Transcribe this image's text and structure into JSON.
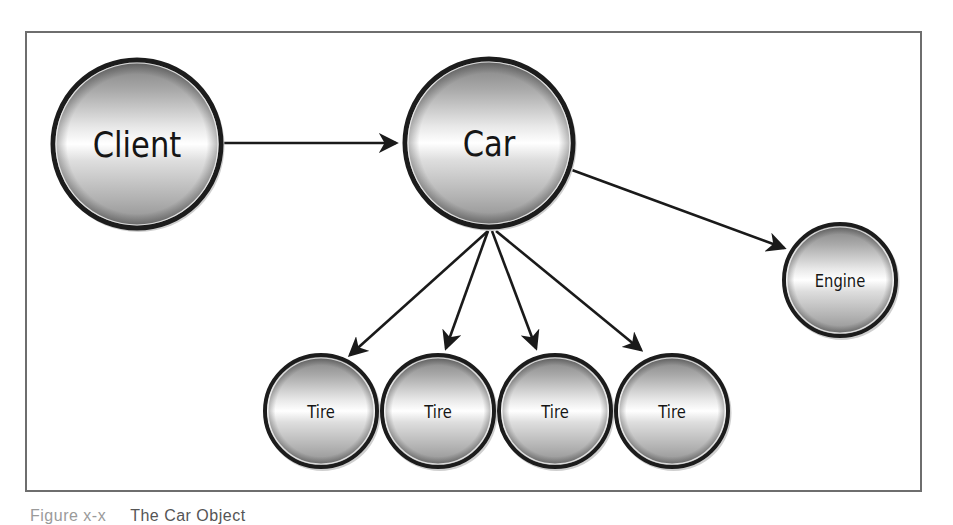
{
  "figure": {
    "caption_number": "Figure x-x",
    "caption_title": "The Car Object"
  },
  "colors": {
    "frame_border": "#6e6e6e",
    "node_outline": "#1c1c1c",
    "node_gradient_top": "#8a8a8a",
    "node_gradient_mid": "#f6f6f6",
    "node_gradient_bottom": "#9c9c9c",
    "edge": "#1a1a1a",
    "label": "#151515"
  },
  "nodes": [
    {
      "id": "client",
      "label": "Client",
      "cx": 137,
      "cy": 144,
      "r": 86,
      "font_size": 36
    },
    {
      "id": "car",
      "label": "Car",
      "cx": 489,
      "cy": 143,
      "r": 86,
      "font_size": 36
    },
    {
      "id": "engine",
      "label": "Engine",
      "cx": 840,
      "cy": 280,
      "r": 58,
      "font_size": 18
    },
    {
      "id": "tire1",
      "label": "Tire",
      "cx": 321,
      "cy": 411,
      "r": 58,
      "font_size": 18
    },
    {
      "id": "tire2",
      "label": "Tire",
      "cx": 438,
      "cy": 411,
      "r": 58,
      "font_size": 18
    },
    {
      "id": "tire3",
      "label": "Tire",
      "cx": 555,
      "cy": 411,
      "r": 58,
      "font_size": 18
    },
    {
      "id": "tire4",
      "label": "Tire",
      "cx": 672,
      "cy": 411,
      "r": 58,
      "font_size": 18
    }
  ],
  "edges": [
    {
      "from": "client",
      "to": "car",
      "x1": 222,
      "y1": 143,
      "x2": 396,
      "y2": 143
    },
    {
      "from": "car",
      "to": "engine",
      "x1": 572,
      "y1": 170,
      "x2": 784,
      "y2": 248
    },
    {
      "from": "car",
      "to": "tire1",
      "x1": 488,
      "y1": 231,
      "x2": 350,
      "y2": 355
    },
    {
      "from": "car",
      "to": "tire2",
      "x1": 488,
      "y1": 231,
      "x2": 446,
      "y2": 348
    },
    {
      "from": "car",
      "to": "tire3",
      "x1": 492,
      "y1": 231,
      "x2": 536,
      "y2": 348
    },
    {
      "from": "car",
      "to": "tire4",
      "x1": 496,
      "y1": 231,
      "x2": 641,
      "y2": 350
    }
  ]
}
